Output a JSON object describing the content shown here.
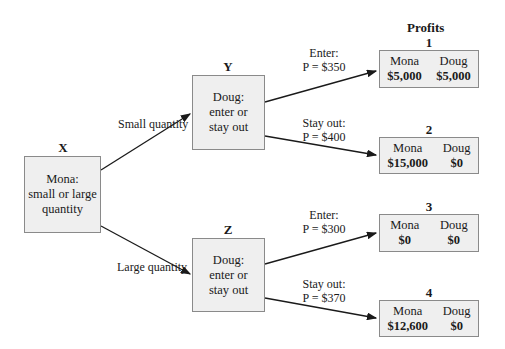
{
  "profits_title": "Profits",
  "nodes": {
    "x": {
      "label": "X",
      "text_lines": [
        "Mona:",
        "small or large",
        "quantity"
      ]
    },
    "y": {
      "label": "Y",
      "text_lines": [
        "Doug:",
        "enter or",
        "stay out"
      ]
    },
    "z": {
      "label": "Z",
      "text_lines": [
        "Doug:",
        "enter or",
        "stay out"
      ]
    }
  },
  "branches": {
    "x_to_y": "Small quantity",
    "x_to_z": "Large quantity",
    "y_enter": {
      "line1": "Enter:",
      "line2": "P = $350"
    },
    "y_stay": {
      "line1": "Stay out:",
      "line2": "P = $400"
    },
    "z_enter": {
      "line1": "Enter:",
      "line2": "P = $300"
    },
    "z_stay": {
      "line1": "Stay out:",
      "line2": "P = $370"
    }
  },
  "outcomes": [
    {
      "number": "1",
      "player1": "Mona",
      "player2": "Doug",
      "value1": "$5,000",
      "value2": "$5,000"
    },
    {
      "number": "2",
      "player1": "Mona",
      "player2": "Doug",
      "value1": "$15,000",
      "value2": "$0"
    },
    {
      "number": "3",
      "player1": "Mona",
      "player2": "Doug",
      "value1": "$0",
      "value2": "$0"
    },
    {
      "number": "4",
      "player1": "Mona",
      "player2": "Doug",
      "value1": "$12,600",
      "value2": "$0"
    }
  ]
}
